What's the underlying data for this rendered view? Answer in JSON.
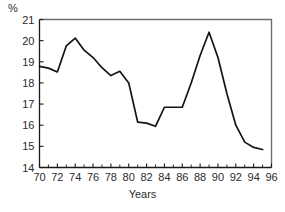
{
  "chart_data": {
    "type": "line",
    "title": "",
    "xlabel": "Years",
    "ylabel": "%",
    "ylim": [
      14,
      21
    ],
    "xlim": [
      70,
      96
    ],
    "ytick_labels": [
      "14",
      "15",
      "16",
      "17",
      "18",
      "19",
      "20",
      "21"
    ],
    "ytick_values": [
      14,
      15,
      16,
      17,
      18,
      19,
      20,
      21
    ],
    "xtick_labels": [
      "70",
      "72",
      "74",
      "76",
      "78",
      "80",
      "82",
      "84",
      "86",
      "88",
      "90",
      "92",
      "94",
      "96"
    ],
    "xtick_values": [
      70,
      72,
      74,
      76,
      78,
      80,
      82,
      84,
      86,
      88,
      90,
      92,
      94,
      96
    ],
    "xtick_minor_values": [
      71,
      73,
      75,
      77,
      79,
      81,
      83,
      85,
      87,
      89,
      91,
      93,
      95
    ],
    "grid": false,
    "legend": false,
    "line_color": "#141414",
    "axis_color": "#6e6e6e",
    "series": [
      {
        "name": "percent",
        "x": [
          70,
          71,
          72,
          73,
          74,
          75,
          76,
          77,
          78,
          79,
          80,
          81,
          82,
          83,
          84,
          85,
          86,
          87,
          88,
          89,
          90,
          91,
          92,
          93,
          94,
          95
        ],
        "values": [
          18.78,
          18.7,
          18.52,
          19.75,
          20.12,
          19.55,
          19.2,
          18.72,
          18.35,
          18.55,
          18.0,
          16.15,
          16.1,
          15.95,
          16.85,
          16.85,
          16.85,
          18.0,
          19.3,
          20.4,
          19.2,
          17.5,
          16.0,
          15.2,
          14.95,
          14.85
        ]
      }
    ]
  },
  "axis": {
    "unit_label": "%",
    "x_title": "Years"
  }
}
